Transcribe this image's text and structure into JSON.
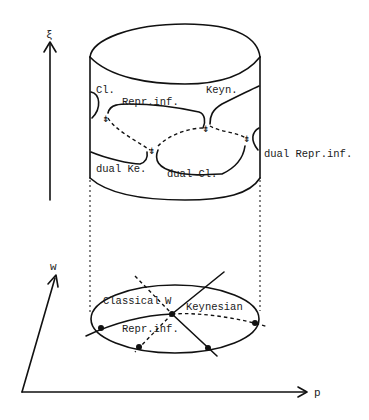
{
  "figure": {
    "vertical_axis_label": "ξ",
    "axes": {
      "w_label": "w",
      "p_label": "p"
    },
    "cylinder_labels": {
      "classical": "Cl.",
      "keynesian": "Keyn.",
      "repressed_inflation": "Repr.inf.",
      "dual_keynesian": "dual Ke.",
      "dual_classical": "dual Cl.",
      "dual_repressed_inflation": "dual Repr.inf."
    },
    "base_labels": {
      "classical": "Classical",
      "walrasian": "W",
      "keynesian": "Keynesian",
      "repressed_inflation": "Repr.inf."
    },
    "cusp_arrow_glyph": "⇟"
  }
}
